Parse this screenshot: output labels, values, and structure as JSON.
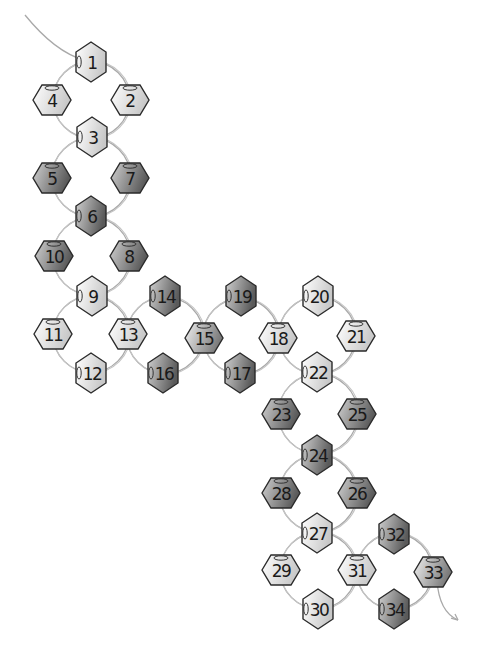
{
  "diagram": {
    "type": "bead-weaving-pattern",
    "thread_color": "#a9a9a9",
    "tones": {
      "light": [
        "#ffffff",
        "#c8c8c8"
      ],
      "medium": [
        "#f0f0f0",
        "#7a7a7a"
      ],
      "dark": [
        "#d0d0d0",
        "#5a5a5a"
      ]
    },
    "beads": [
      {
        "n": "1",
        "x": 91,
        "y": 62,
        "orient": "v",
        "tone": "light"
      },
      {
        "n": "2",
        "x": 130,
        "y": 100,
        "orient": "h",
        "tone": "light"
      },
      {
        "n": "3",
        "x": 92,
        "y": 137,
        "orient": "v",
        "tone": "light"
      },
      {
        "n": "4",
        "x": 52,
        "y": 100,
        "orient": "h",
        "tone": "light"
      },
      {
        "n": "5",
        "x": 52,
        "y": 178,
        "orient": "h",
        "tone": "dark"
      },
      {
        "n": "6",
        "x": 91,
        "y": 216,
        "orient": "v",
        "tone": "dark"
      },
      {
        "n": "7",
        "x": 130,
        "y": 178,
        "orient": "h",
        "tone": "dark"
      },
      {
        "n": "8",
        "x": 129,
        "y": 256,
        "orient": "h",
        "tone": "dark"
      },
      {
        "n": "9",
        "x": 92,
        "y": 296,
        "orient": "v",
        "tone": "light"
      },
      {
        "n": "10",
        "x": 54,
        "y": 256,
        "orient": "h",
        "tone": "dark"
      },
      {
        "n": "11",
        "x": 53,
        "y": 334,
        "orient": "h",
        "tone": "light"
      },
      {
        "n": "12",
        "x": 91,
        "y": 373,
        "orient": "v",
        "tone": "light"
      },
      {
        "n": "13",
        "x": 128,
        "y": 334,
        "orient": "h",
        "tone": "light"
      },
      {
        "n": "14",
        "x": 165,
        "y": 296,
        "orient": "v",
        "tone": "dark"
      },
      {
        "n": "15",
        "x": 204,
        "y": 338,
        "orient": "h",
        "tone": "medium"
      },
      {
        "n": "16",
        "x": 163,
        "y": 373,
        "orient": "v",
        "tone": "dark"
      },
      {
        "n": "17",
        "x": 240,
        "y": 373,
        "orient": "v",
        "tone": "dark"
      },
      {
        "n": "18",
        "x": 278,
        "y": 338,
        "orient": "h",
        "tone": "light"
      },
      {
        "n": "19",
        "x": 241,
        "y": 296,
        "orient": "v",
        "tone": "dark"
      },
      {
        "n": "20",
        "x": 318,
        "y": 296,
        "orient": "v",
        "tone": "light"
      },
      {
        "n": "21",
        "x": 356,
        "y": 336,
        "orient": "h",
        "tone": "light"
      },
      {
        "n": "22",
        "x": 317,
        "y": 372,
        "orient": "v",
        "tone": "light"
      },
      {
        "n": "23",
        "x": 281,
        "y": 414,
        "orient": "h",
        "tone": "dark"
      },
      {
        "n": "24",
        "x": 317,
        "y": 455,
        "orient": "v",
        "tone": "dark"
      },
      {
        "n": "25",
        "x": 357,
        "y": 414,
        "orient": "h",
        "tone": "dark"
      },
      {
        "n": "26",
        "x": 357,
        "y": 493,
        "orient": "h",
        "tone": "dark"
      },
      {
        "n": "27",
        "x": 317,
        "y": 533,
        "orient": "v",
        "tone": "light"
      },
      {
        "n": "28",
        "x": 281,
        "y": 493,
        "orient": "h",
        "tone": "dark"
      },
      {
        "n": "29",
        "x": 281,
        "y": 570,
        "orient": "h",
        "tone": "light"
      },
      {
        "n": "30",
        "x": 318,
        "y": 609,
        "orient": "v",
        "tone": "light"
      },
      {
        "n": "31",
        "x": 357,
        "y": 570,
        "orient": "h",
        "tone": "light"
      },
      {
        "n": "32",
        "x": 394,
        "y": 534,
        "orient": "v",
        "tone": "dark"
      },
      {
        "n": "33",
        "x": 433,
        "y": 572,
        "orient": "h",
        "tone": "medium"
      },
      {
        "n": "34",
        "x": 394,
        "y": 609,
        "orient": "v",
        "tone": "dark"
      }
    ],
    "loops": [
      [
        "1",
        "2",
        "3",
        "4"
      ],
      [
        "3",
        "7",
        "6",
        "5"
      ],
      [
        "6",
        "8",
        "9",
        "10"
      ],
      [
        "9",
        "13",
        "12",
        "11"
      ],
      [
        "13",
        "14",
        "15",
        "16"
      ],
      [
        "15",
        "19",
        "18",
        "17"
      ],
      [
        "18",
        "20",
        "21",
        "22"
      ],
      [
        "22",
        "25",
        "24",
        "23"
      ],
      [
        "24",
        "26",
        "27",
        "28"
      ],
      [
        "27",
        "31",
        "30",
        "29"
      ],
      [
        "31",
        "32",
        "33",
        "34"
      ]
    ],
    "thread_start": {
      "x1": 25,
      "y1": 15,
      "x2": 84,
      "y2": 60
    },
    "thread_end": {
      "x1": 437,
      "y1": 580,
      "x2": 458,
      "y2": 620
    }
  }
}
